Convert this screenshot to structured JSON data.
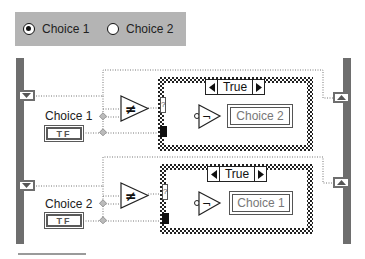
{
  "radio_group": {
    "options": [
      {
        "label": "Choice 1",
        "selected": true
      },
      {
        "label": "Choice 2",
        "selected": false
      }
    ]
  },
  "diagram": {
    "rows": [
      {
        "control_label": "Choice 1",
        "control_type": "TF",
        "compare_symbol": "≠",
        "case_selector": "True",
        "not_symbol": "¬",
        "selector_terminal": "?",
        "indicator_label": "Choice 2"
      },
      {
        "control_label": "Choice 2",
        "control_type": "TF",
        "compare_symbol": "≠",
        "case_selector": "True",
        "not_symbol": "¬",
        "selector_terminal": "?",
        "indicator_label": "Choice 1"
      }
    ]
  },
  "icons": {
    "left_tunnel": "shift-register-down-arrow",
    "right_tunnel": "shift-register-up-arrow",
    "case_prev": "left-triangle",
    "case_next": "right-triangle"
  },
  "colors": {
    "panel_bg": "#b4b4b4",
    "loop_bar": "#6e6e6e",
    "wire": "#777777"
  }
}
